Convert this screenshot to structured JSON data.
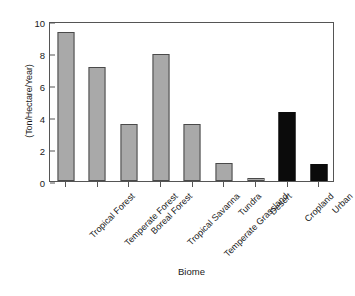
{
  "chart_data": {
    "type": "bar",
    "title": "",
    "subtitle": "",
    "xlabel": "Biome",
    "ylabel": "(Ton/Hectare/Year)",
    "categories": [
      "Tropical Forest",
      "Temperate Forest",
      "Boreal Forest",
      "Tropical Savanna",
      "Temperate Grassland",
      "Tundra",
      "Desert",
      "Cropland",
      "Urban"
    ],
    "values": [
      9.3,
      7.1,
      3.55,
      7.95,
      3.55,
      1.1,
      0.2,
      4.3,
      1.05
    ],
    "bar_colors": [
      "#a9a9a9",
      "#a9a9a9",
      "#a9a9a9",
      "#a9a9a9",
      "#a9a9a9",
      "#a9a9a9",
      "#a9a9a9",
      "#0b0b0b",
      "#0b0b0b"
    ],
    "ylim": [
      0,
      10
    ],
    "yticks": [
      0,
      2,
      4,
      6,
      8,
      10
    ],
    "ytick_labels": [
      "0",
      "2",
      "4",
      "6",
      "8",
      "10"
    ],
    "grid": false,
    "legend": null,
    "legend_position": "none",
    "frame": "box",
    "xtick_label_rotation": -45,
    "series": [
      {
        "name": "Net Primary Productivity",
        "values": [
          9.3,
          7.1,
          3.55,
          7.95,
          3.55,
          1.1,
          0.2,
          4.3,
          1.05
        ]
      }
    ]
  },
  "colors": {
    "natural_biome": "#a9a9a9",
    "human_biome": "#0b0b0b",
    "axis": "#555555",
    "text": "#1a1a1a",
    "background": "#ffffff"
  }
}
